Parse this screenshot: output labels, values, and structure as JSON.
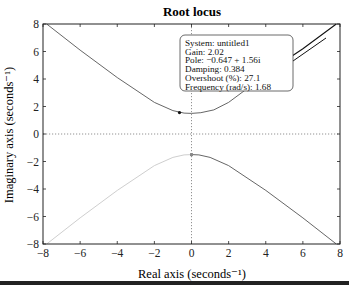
{
  "chart_data": {
    "type": "line",
    "title": "Root locus",
    "xlabel": "Real axis (seconds⁻¹)",
    "ylabel": "Imaginary axis (seconds⁻¹)",
    "xlim": [
      -8,
      8
    ],
    "ylim": [
      -8,
      8
    ],
    "xticks": [
      "−8",
      "−6",
      "−4",
      "−2",
      "0",
      "2",
      "4",
      "6",
      "8"
    ],
    "yticks": [
      "8",
      "6",
      "4",
      "2",
      "0",
      "−2",
      "−4",
      "−6",
      "−8"
    ],
    "grid": false,
    "series": [
      {
        "name": "upper-left branch",
        "x": [
          -7.8,
          -6,
          -4,
          -2,
          -1,
          -0.4,
          0
        ],
        "y": [
          8,
          6.1,
          4.1,
          2.3,
          1.7,
          1.52,
          1.5
        ]
      },
      {
        "name": "upper-right branch",
        "x": [
          0,
          0.5,
          1.2,
          2,
          3,
          4
        ],
        "y": [
          1.5,
          1.55,
          1.75,
          2.3,
          3.3,
          4.4
        ]
      },
      {
        "name": "upper-right extension",
        "x": [
          4,
          6,
          7.8
        ],
        "y": [
          4.4,
          6.2,
          8
        ]
      },
      {
        "name": "lower-left branch",
        "x": [
          -7.8,
          -6,
          -4,
          -2,
          -1,
          -0.4,
          0
        ],
        "y": [
          -8,
          -6.1,
          -4.1,
          -2.3,
          -1.7,
          -1.52,
          -1.5
        ]
      },
      {
        "name": "lower-right branch",
        "x": [
          0,
          0.4,
          1,
          2,
          4,
          6,
          7.8
        ],
        "y": [
          -1.5,
          -1.52,
          -1.7,
          -2.3,
          -4.1,
          -6.1,
          -8
        ]
      }
    ],
    "marker": {
      "x": -0.647,
      "y": 1.56
    }
  },
  "datatip": {
    "lines": [
      "System: untitled1",
      "Gain: 2.02",
      "Pole: −0.647 + 1.56i",
      "Damping: 0.384",
      "Overshoot (%): 27.1",
      "Frequency (rad/s): 1.68"
    ]
  },
  "colors": {
    "curve": "#555555",
    "curve_light": "#c8c8c8",
    "axis": "#222222"
  }
}
